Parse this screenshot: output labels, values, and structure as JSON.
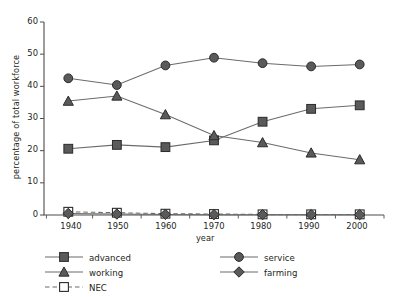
{
  "chart_data": {
    "type": "line",
    "title": "",
    "xlabel": "year",
    "ylabel": "percentage of total workforce",
    "x": [
      1940,
      1950,
      1960,
      1970,
      1980,
      1990,
      2000
    ],
    "xticklabels": [
      "1940",
      "1950",
      "1960",
      "1970",
      "1980",
      "1990",
      "2000"
    ],
    "yticklabels": [
      "0",
      "10",
      "20",
      "30",
      "40",
      "50",
      "60"
    ],
    "ylim": [
      0,
      60
    ],
    "xlim": [
      1935,
      2005
    ],
    "grid": false,
    "legend_position": "below-axes",
    "series": [
      {
        "name": "advanced",
        "marker": "square-filled",
        "linestyle": "solid",
        "values": [
          20.6,
          21.8,
          21.1,
          23.2,
          29.0,
          33.0,
          34.1
        ]
      },
      {
        "name": "working",
        "marker": "triangle-filled",
        "linestyle": "solid",
        "values": [
          35.4,
          37.0,
          31.2,
          24.7,
          22.5,
          19.3,
          17.2
        ]
      },
      {
        "name": "NEC",
        "marker": "square-open",
        "linestyle": "dashed",
        "values": [
          1.0,
          0.7,
          0.4,
          0.3,
          0.2,
          0.2,
          0.2
        ]
      },
      {
        "name": "service",
        "marker": "circle-filled",
        "linestyle": "solid",
        "values": [
          42.5,
          40.4,
          46.5,
          48.9,
          47.2,
          46.2,
          46.8
        ]
      },
      {
        "name": "farming",
        "marker": "diamond-filled",
        "linestyle": "solid",
        "values": [
          0.5,
          0.3,
          0.2,
          0.1,
          0.1,
          0.1,
          0.1
        ]
      }
    ]
  },
  "axis": {
    "ylabel": "percentage of total workforce",
    "xlabel": "year",
    "yticks": [
      "60",
      "50",
      "40",
      "30",
      "20",
      "10",
      "0"
    ],
    "xticks": [
      "1940",
      "1950",
      "1960",
      "1970",
      "1980",
      "1990",
      "2000"
    ]
  },
  "legend": {
    "items": [
      {
        "label": "advanced",
        "marker": "square-filled"
      },
      {
        "label": "working",
        "marker": "triangle-filled"
      },
      {
        "label": "NEC",
        "marker": "square-open"
      },
      {
        "label": "service",
        "marker": "circle-filled"
      },
      {
        "label": "farming",
        "marker": "diamond-filled"
      }
    ]
  },
  "colors": {
    "marker_fill": "#5a5a5a",
    "marker_edge": "#2b2b2b",
    "line": "#6b6b6b",
    "axis": "#4d4d4d",
    "text": "#231f20",
    "background": "#ffffff"
  }
}
